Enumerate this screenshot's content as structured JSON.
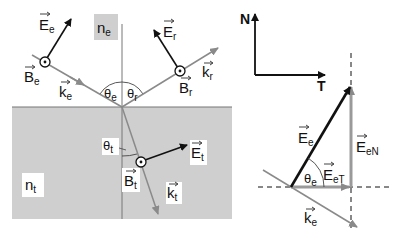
{
  "left_diagram": {
    "medium_incident_label": "n",
    "medium_incident_sub": "e",
    "medium_transmitted_label": "n",
    "medium_transmitted_sub": "t",
    "incident": {
      "E_label": "E",
      "E_sub": "e",
      "B_label": "B",
      "B_sub": "e",
      "k_label": "k",
      "k_sub": "e",
      "angle_label": "θ",
      "angle_sub": "e"
    },
    "reflected": {
      "E_label": "E",
      "E_sub": "r",
      "B_label": "B",
      "B_sub": "r",
      "k_label": "k",
      "k_sub": "r",
      "angle_label": "θ",
      "angle_sub": "r"
    },
    "transmitted": {
      "E_label": "E",
      "E_sub": "t",
      "B_label": "B",
      "B_sub": "t",
      "k_label": "k",
      "k_sub": "t",
      "angle_label": "θ",
      "angle_sub": "t"
    }
  },
  "right_diagram": {
    "axis_N": "N",
    "axis_T": "T",
    "E_label": "E",
    "E_sub": "e",
    "EN_label": "E",
    "EN_sub": "eN",
    "ET_label": "E",
    "ET_sub": "eT",
    "k_label": "k",
    "k_sub": "e",
    "angle_label": "θ",
    "angle_sub": "e"
  },
  "colors": {
    "medium_fill": "#cfcfcf",
    "gray_ray": "#8a8a8a",
    "black_vector": "#111111",
    "label_box": "#ffffff",
    "ne_box": "#cfcfcf"
  }
}
